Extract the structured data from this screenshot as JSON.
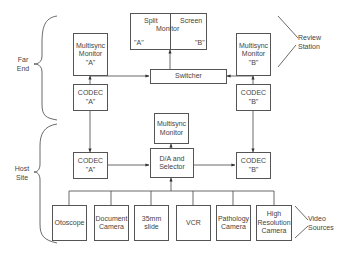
{
  "diagram": {
    "type": "block-diagram",
    "groups": {
      "far_end": {
        "line1": "Far",
        "line2": "End"
      },
      "host_site": {
        "line1": "Host",
        "line2": "Site"
      },
      "review_station": {
        "line1": "Review",
        "line2": "Station"
      },
      "video_sources": {
        "line1": "Video",
        "line2": "Sources"
      }
    },
    "split_screen_monitor": {
      "left_top": "Split",
      "right_top": "Screen",
      "center": "Monitor",
      "left_bottom": "\"A\"",
      "right_bottom": "\"B\""
    },
    "nodes": {
      "monitor_a": {
        "line1": "Multisync",
        "line2": "Monitor",
        "line3": "\"A\""
      },
      "monitor_b": {
        "line1": "Multisync",
        "line2": "Monitor",
        "line3": "\"B\""
      },
      "switcher": {
        "line1": "Switcher"
      },
      "far_codec_a": {
        "line1": "CODEC",
        "line2": "\"A\""
      },
      "far_codec_b": {
        "line1": "CODEC",
        "line2": "\"B\""
      },
      "host_monitor": {
        "line1": "Multisync",
        "line2": "Monitor"
      },
      "host_codec_a": {
        "line1": "CODEC",
        "line2": "\"A\""
      },
      "da_selector": {
        "line1": "D/A and",
        "line2": "Selector"
      },
      "host_codec_b": {
        "line1": "CODEC",
        "line2": "\"B\""
      }
    },
    "sources": [
      {
        "line1": "Otoscope",
        "line2": "",
        "line3": ""
      },
      {
        "line1": "Document",
        "line2": "Camera",
        "line3": ""
      },
      {
        "line1": "35mm",
        "line2": "slide",
        "line3": ""
      },
      {
        "line1": "VCR",
        "line2": "",
        "line3": ""
      },
      {
        "line1": "Pathology",
        "line2": "Camera",
        "line3": ""
      },
      {
        "line1": "High",
        "line2": "Resolution",
        "line3": "Camera"
      }
    ],
    "edges": [
      [
        "far_codec_a",
        "monitor_a"
      ],
      [
        "far_codec_a",
        "switcher"
      ],
      [
        "far_codec_b",
        "monitor_b"
      ],
      [
        "far_codec_b",
        "switcher"
      ],
      [
        "switcher",
        "split_screen_monitor"
      ],
      [
        "far_codec_a",
        "host_codec_a",
        "bidirectional"
      ],
      [
        "far_codec_b",
        "host_codec_b",
        "bidirectional"
      ],
      [
        "host_codec_a",
        "da_selector",
        "bidirectional"
      ],
      [
        "da_selector",
        "host_codec_b",
        "bidirectional"
      ],
      [
        "da_selector",
        "host_monitor"
      ],
      [
        "sources",
        "da_selector"
      ]
    ]
  }
}
